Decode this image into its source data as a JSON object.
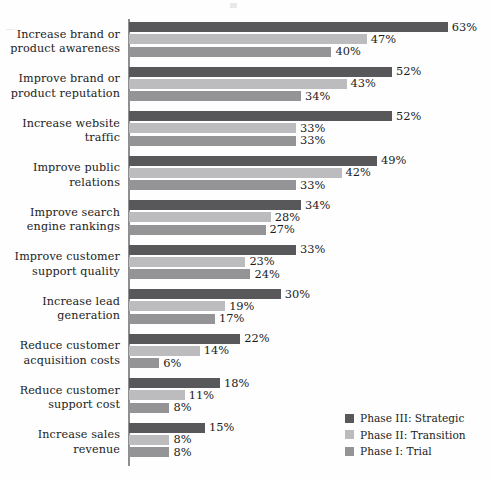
{
  "chart_data": {
    "type": "bar",
    "orientation": "horizontal",
    "title": "",
    "subtitle": "",
    "xlabel": "",
    "ylabel": "",
    "xlim": [
      0,
      70
    ],
    "grid": false,
    "value_suffix": "%",
    "legend_position": "bottom-right",
    "categories": [
      "Increase brand or product awareness",
      "Improve brand or product reputation",
      "Increase website traffic",
      "Improve public relations",
      "Improve search engine rankings",
      "Improve customer support quality",
      "Increase lead generation",
      "Reduce customer acquisition costs",
      "Reduce customer support cost",
      "Increase sales revenue"
    ],
    "category_lines": [
      [
        "Increase brand or",
        "product awareness"
      ],
      [
        "Improve brand or",
        "product reputation"
      ],
      [
        "Increase website",
        "traffic"
      ],
      [
        "Improve public",
        "relations"
      ],
      [
        "Improve search",
        "engine rankings"
      ],
      [
        "Improve customer",
        "support quality"
      ],
      [
        "Increase lead",
        "generation"
      ],
      [
        "Reduce customer",
        "acquisition costs"
      ],
      [
        "Reduce customer",
        "support cost"
      ],
      [
        "Increase sales",
        "revenue"
      ]
    ],
    "series": [
      {
        "name": "Phase III: Strategic",
        "color": "#58585a",
        "values": [
          63,
          52,
          52,
          49,
          34,
          33,
          30,
          22,
          18,
          15
        ],
        "labels": [
          "63%",
          "52%",
          "52%",
          "49%",
          "34%",
          "33%",
          "30%",
          "22%",
          "18%",
          "15%"
        ]
      },
      {
        "name": "Phase II: Transition",
        "color": "#bcbcbe",
        "values": [
          47,
          43,
          33,
          42,
          28,
          23,
          19,
          14,
          11,
          8
        ],
        "labels": [
          "47%",
          "43%",
          "33%",
          "42%",
          "28%",
          "23%",
          "19%",
          "14%",
          "11%",
          "8%"
        ]
      },
      {
        "name": "Phase I: Trial",
        "color": "#949496",
        "values": [
          40,
          34,
          33,
          33,
          27,
          24,
          17,
          6,
          8,
          8
        ],
        "labels": [
          "40%",
          "34%",
          "33%",
          "33%",
          "27%",
          "24%",
          "17%",
          "6%",
          "8%",
          "8%"
        ]
      }
    ]
  },
  "legend": {
    "items": [
      {
        "label": "Phase III: Strategic",
        "color": "#58585a"
      },
      {
        "label": "Phase II: Transition",
        "color": "#bcbcbe"
      },
      {
        "label": "Phase I: Trial",
        "color": "#949496"
      }
    ]
  },
  "axis": {
    "color": "#8e8e90"
  }
}
